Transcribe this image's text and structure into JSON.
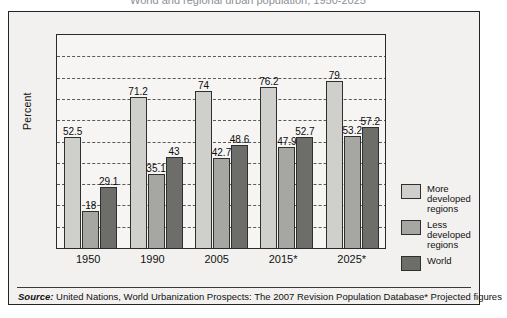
{
  "title": "World and regional urban population, 1950-2025",
  "axis": {
    "ylabel": "Percent",
    "yticks": [
      "100",
      "90",
      "80",
      "70",
      "60",
      "50",
      "40",
      "30",
      "20",
      "10",
      "0"
    ]
  },
  "legend": [
    {
      "label": "More developed regions",
      "color": "#cfcfcb"
    },
    {
      "label": "Less developed regions",
      "color": "#a6a6a2"
    },
    {
      "label": "World",
      "color": "#6d6d6a"
    }
  ],
  "footer": {
    "source_label": "Source:",
    "source_text": " United Nations, World Urbanization Prospects: The 2007 Revision Population Database",
    "projected_note": "*  Projected figures"
  },
  "chart_data": {
    "type": "bar",
    "title": "World and regional urban population, 1950-2025",
    "xlabel": "",
    "ylabel": "Percent",
    "ylim": [
      0,
      100
    ],
    "ytick_step": 10,
    "grid": true,
    "legend_position": "right",
    "categories": [
      "1950",
      "1990",
      "2005",
      "2015*",
      "2025*"
    ],
    "series": [
      {
        "name": "More developed regions",
        "color": "#cfcfcb",
        "values": [
          52.5,
          71.2,
          74,
          76.2,
          79
        ],
        "labels": [
          "52.5",
          "71.2",
          "74",
          "76.2",
          "79"
        ]
      },
      {
        "name": "Less developed regions",
        "color": "#a6a6a2",
        "values": [
          18,
          35.1,
          42.7,
          47.9,
          53.2
        ],
        "labels": [
          "18",
          "35.1",
          "42.7",
          "47.9",
          "53.2"
        ]
      },
      {
        "name": "World",
        "color": "#6d6d6a",
        "values": [
          29.1,
          43,
          48.6,
          52.7,
          57.2
        ],
        "labels": [
          "29.1",
          "43",
          "48.6",
          "52.7",
          "57.2"
        ]
      }
    ]
  }
}
